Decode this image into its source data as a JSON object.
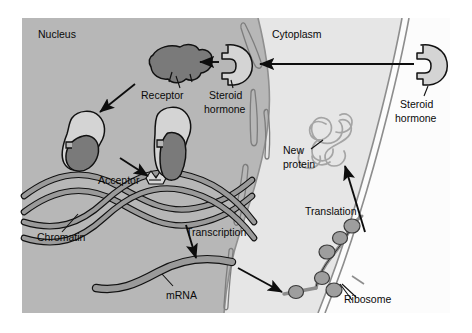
{
  "figure": {
    "background_color": "#ffffff"
  },
  "colors": {
    "page_background": "#ffffff",
    "nucleus_fill": "#b7b7b7",
    "cytoplasm_fill": "#e6e6e6",
    "extracellular_fill": "#ffffff",
    "receptor_dark": "#7a7a7a",
    "hormone_light": "#d4d4d4",
    "dna_band": "#9a9a9a",
    "mrna_band": "#9a9a9a",
    "ribosome_fill": "#9e9e9e",
    "protein_thread": "#a5a5a5",
    "outline": "#111111",
    "membrane_line": "#8d8d8d"
  },
  "regions": {
    "nucleus_label": "Nucleus",
    "cytoplasm_label": "Cytoplasm"
  },
  "labels": {
    "receptor": "Receptor",
    "steroid_hormone_inside": "Steroid\nhormone",
    "steroid_hormone_inside_line1": "Steroid",
    "steroid_hormone_inside_line2": "hormone",
    "steroid_hormone_outside_line1": "Steroid",
    "steroid_hormone_outside_line2": "hormone",
    "acceptor": "Acceptor",
    "chromatin": "Chromatin",
    "transcription": "Transcription",
    "mrna": "mRNA",
    "ribosome": "Ribosome",
    "translation": "Translation",
    "new_protein_line1": "New",
    "new_protein_line2": "protein"
  },
  "structures": [
    {
      "name": "steroid-hormone-extracellular",
      "type": "hormone",
      "description": "Light gray notched disc outside the cell"
    },
    {
      "name": "steroid-hormone-cytoplasm",
      "type": "hormone",
      "description": "Light gray notched disc entering the nucleus"
    },
    {
      "name": "receptor",
      "type": "receptor",
      "description": "Dark gray irregular receptor protein in nucleus"
    },
    {
      "name": "hormone-receptor-complex-1",
      "type": "complex",
      "description": "Hormone bound to receptor, migrating"
    },
    {
      "name": "hormone-receptor-complex-2",
      "type": "complex",
      "description": "Hormone-receptor complex docked on chromatin acceptor site"
    },
    {
      "name": "chromatin",
      "type": "dna",
      "description": "Double-helix DNA ribbon across nucleus"
    },
    {
      "name": "acceptor-site",
      "type": "binding-site",
      "description": "Small notch on the DNA where the complex binds"
    },
    {
      "name": "mrna-strand",
      "type": "rna",
      "description": "Gray wavy mRNA band produced by transcription"
    },
    {
      "name": "nuclear-envelope",
      "type": "membrane",
      "description": "Curved nuclear membrane with pores"
    },
    {
      "name": "cell-membrane",
      "type": "membrane",
      "description": "Outer plasma membrane double line"
    },
    {
      "name": "ribosome-chain",
      "type": "ribosome",
      "description": "mRNA threaded with gray ribosome beads"
    },
    {
      "name": "new-protein",
      "type": "protein",
      "description": "Tangled gray polypeptide thread"
    }
  ],
  "arrows": [
    {
      "name": "arrow-hormone-entry",
      "from": "steroid-hormone-extracellular",
      "to": "steroid-hormone-cytoplasm",
      "label": ""
    },
    {
      "name": "arrow-hormone-to-receptor",
      "from": "steroid-hormone-cytoplasm",
      "to": "receptor",
      "label": ""
    },
    {
      "name": "arrow-receptor-to-complex",
      "from": "receptor",
      "to": "hormone-receptor-complex-1",
      "label": ""
    },
    {
      "name": "arrow-complex-to-acceptor",
      "from": "hormone-receptor-complex-1",
      "to": "acceptor-site",
      "label": ""
    },
    {
      "name": "arrow-transcription",
      "from": "chromatin",
      "to": "mrna-strand",
      "label": "Transcription"
    },
    {
      "name": "arrow-mrna-to-ribosome",
      "from": "mrna-strand",
      "to": "ribosome-chain",
      "label": ""
    },
    {
      "name": "arrow-translation",
      "from": "ribosome-chain",
      "to": "new-protein",
      "label": "Translation"
    }
  ]
}
